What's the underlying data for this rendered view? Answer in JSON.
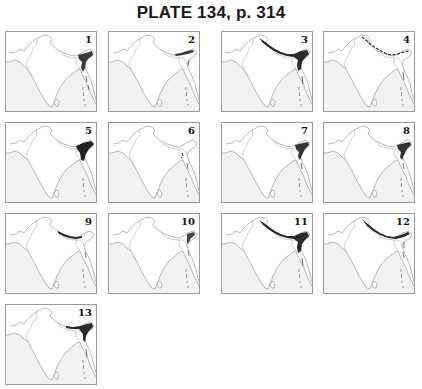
{
  "title": "PLATE 134, p. 314",
  "maps": [
    {
      "label": "1",
      "distribution": "ne-india-myanmar"
    },
    {
      "label": "2",
      "distribution": "eastern-himalaya-narrow"
    },
    {
      "label": "3",
      "distribution": "himalaya-ne-heavy"
    },
    {
      "label": "4",
      "distribution": "himalaya-full-light"
    },
    {
      "label": "5",
      "distribution": "ne-india-heavy"
    },
    {
      "label": "6",
      "distribution": "bangladesh-spot"
    },
    {
      "label": "7",
      "distribution": "ne-india-hills"
    },
    {
      "label": "8",
      "distribution": "ne-india-hills"
    },
    {
      "label": "9",
      "distribution": "central-himalaya"
    },
    {
      "label": "10",
      "distribution": "ne-india-light"
    },
    {
      "label": "11",
      "distribution": "himalaya-ne-heavy"
    },
    {
      "label": "12",
      "distribution": "himalaya-full"
    },
    {
      "label": "13",
      "distribution": "eastern-himalaya-ne"
    }
  ],
  "colors": {
    "border": "#9a9a9a",
    "land": "#ffffff",
    "sea": "#f2f2f2",
    "range": "#2a2a2a",
    "outline": "#8a8a8a"
  }
}
